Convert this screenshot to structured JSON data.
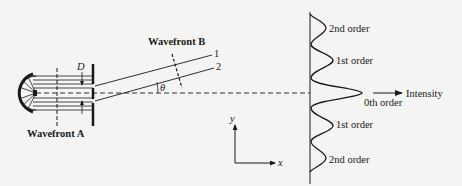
{
  "figure": {
    "labels": {
      "wavefront_a": "Wavefront A",
      "wavefront_b": "Wavefront B",
      "slit_spacing": "D",
      "ray_1": "1",
      "ray_2": "2",
      "angle": "θ",
      "intensity_axis": "Intensity",
      "axis_x": "x",
      "axis_y": "y"
    },
    "orders": [
      {
        "id": "2nd-upper",
        "label": "2nd order"
      },
      {
        "id": "1st-upper",
        "label": "1st order"
      },
      {
        "id": "0th",
        "label": "0th order"
      },
      {
        "id": "1st-lower",
        "label": "1st order"
      },
      {
        "id": "2nd-lower",
        "label": "2nd order"
      }
    ],
    "colors": {
      "ink": "#1a1a1a",
      "paper": "#f4f4f2",
      "bleed_text": "#c9c9c6"
    }
  }
}
